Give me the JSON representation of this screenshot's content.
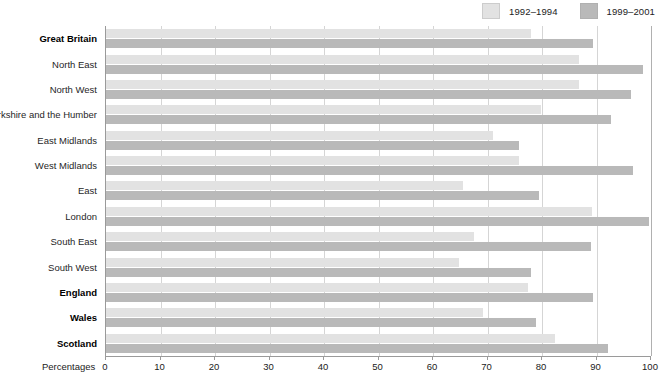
{
  "chart_data": {
    "type": "bar",
    "orientation": "horizontal",
    "title": "",
    "xlabel": "Percentages",
    "ylabel": "",
    "xlim": [
      0,
      100
    ],
    "xticks": [
      0,
      10,
      20,
      30,
      40,
      50,
      60,
      70,
      80,
      90,
      100
    ],
    "grid": true,
    "legend_position": "top-right",
    "categories": [
      "Great Britain",
      "North East",
      "North West",
      "Yorkshire and the Humber",
      "East Midlands",
      "West Midlands",
      "East",
      "London",
      "South East",
      "South West",
      "England",
      "Wales",
      "Scotland"
    ],
    "category_emphasis": [
      true,
      false,
      false,
      false,
      false,
      false,
      false,
      false,
      false,
      false,
      true,
      true,
      true
    ],
    "series": [
      {
        "name": "1992–1994",
        "color": "#e2e2e2",
        "values": [
          78.0,
          86.8,
          86.8,
          79.8,
          71.0,
          75.8,
          65.5,
          89.2,
          67.5,
          64.8,
          77.4,
          69.2,
          82.4
        ]
      },
      {
        "name": "1999–2001",
        "color": "#b9b9b9",
        "values": [
          89.4,
          98.5,
          96.3,
          92.7,
          75.8,
          96.7,
          79.4,
          99.6,
          89.0,
          78.0,
          89.4,
          78.9,
          92.1
        ]
      }
    ]
  },
  "legend": {
    "entries": [
      {
        "label": "1992–1994",
        "color": "#e2e2e2"
      },
      {
        "label": "1999–2001",
        "color": "#b9b9b9"
      }
    ]
  },
  "axis": {
    "x_title": "Percentages"
  }
}
